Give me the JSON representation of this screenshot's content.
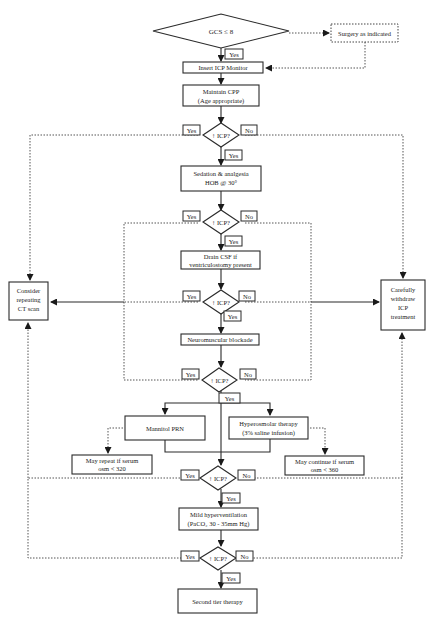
{
  "diagram": {
    "start": {
      "label": "GCS ≤ 8"
    },
    "side_action": {
      "label": "Surgery as indicated"
    },
    "steps": [
      {
        "id": "insert_icp",
        "lines": [
          "Insert ICP Monitor"
        ]
      },
      {
        "id": "maintain_cpp",
        "lines": [
          "Maintain CPP",
          "(Age appropriate)"
        ]
      },
      {
        "id": "sedation",
        "lines": [
          "Sedation & analgesia",
          "HOB @ 30°"
        ]
      },
      {
        "id": "drain_csf",
        "lines": [
          "Drain CSF if",
          "ventriculostomy present"
        ]
      },
      {
        "id": "nm_blockade",
        "lines": [
          "Neuromuscular blockade"
        ]
      },
      {
        "id": "mannitol",
        "lines": [
          "Mannitol PRN"
        ]
      },
      {
        "id": "hyperosmolar",
        "lines": [
          "Hyperosmolar therapy",
          "(3% saline infusion)"
        ]
      },
      {
        "id": "hyperventilation",
        "lines": [
          "Mild hyperventilation",
          "(PaCO₂ 30 - 35mm Hg)"
        ]
      },
      {
        "id": "second_tier",
        "lines": [
          "Second tier therapy"
        ]
      }
    ],
    "decision_label": "↑ ICP?",
    "yes_label": "Yes",
    "no_label": "No",
    "notes": {
      "mannitol": [
        "May repeat if serum",
        "osm < 320"
      ],
      "hyperosmolar": [
        "May continue if serum",
        "osm < 360"
      ]
    },
    "left_box": [
      "Consider",
      "repeating",
      "CT scan"
    ],
    "right_box": [
      "Carefully",
      "withdraw",
      "ICP",
      "treatment"
    ]
  }
}
